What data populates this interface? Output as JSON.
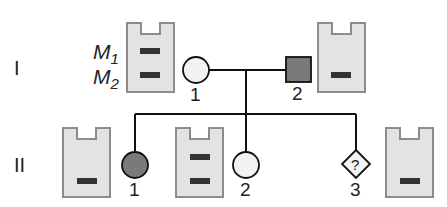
{
  "generations": [
    {
      "label": "I"
    },
    {
      "label": "II"
    }
  ],
  "markers": [
    {
      "label": "M",
      "sub": "1"
    },
    {
      "label": "M",
      "sub": "2"
    }
  ],
  "individuals": [
    {
      "id": "I-1",
      "number": "1",
      "sex": "female",
      "affected": false,
      "bands": [
        "M1",
        "M2"
      ]
    },
    {
      "id": "I-2",
      "number": "2",
      "sex": "male",
      "affected": true,
      "bands": [
        "M2"
      ]
    },
    {
      "id": "II-1",
      "number": "1",
      "sex": "female",
      "affected": true,
      "bands": [
        "M2"
      ]
    },
    {
      "id": "II-2",
      "number": "2",
      "sex": "female",
      "affected": false,
      "bands": [
        "M1",
        "M2"
      ]
    },
    {
      "id": "II-3",
      "number": "3",
      "sex": "unknown",
      "affected": null,
      "symbol_text": "?",
      "bands": [
        "M2"
      ]
    }
  ],
  "colors": {
    "gel_fill": "#e3e3e3",
    "gel_border": "#8c8c8c",
    "band": "#333333",
    "affected": "#7a7a7a",
    "unaffected": "#f2f2f2",
    "line": "#111111"
  }
}
